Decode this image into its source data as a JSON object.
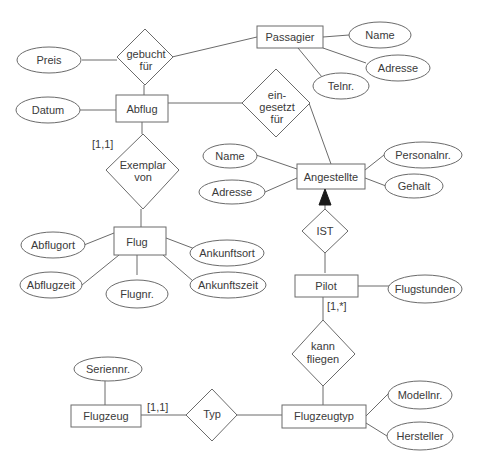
{
  "diagram": {
    "type": "er-diagram",
    "entities": {
      "passagier": "Passagier",
      "abflug": "Abflug",
      "flug": "Flug",
      "angestellte": "Angestellte",
      "pilot": "Pilot",
      "flugzeug": "Flugzeug",
      "flugzeugtyp": "Flugzeugtyp"
    },
    "relationships": {
      "gebucht_fuer": [
        "gebucht",
        "für"
      ],
      "eingesetzt_fuer": [
        "ein-",
        "gesetzt",
        "für"
      ],
      "exemplar_von": [
        "Exemplar",
        "von"
      ],
      "ist": "IST",
      "kann_fliegen": [
        "kann",
        "fliegen"
      ],
      "typ": "Typ"
    },
    "attributes": {
      "passagier_name": "Name",
      "passagier_adresse": "Adresse",
      "passagier_telnr": "Telnr.",
      "preis": "Preis",
      "datum": "Datum",
      "angestellte_name": "Name",
      "angestellte_adresse": "Adresse",
      "personalnr": "Personalnr.",
      "gehalt": "Gehalt",
      "abflugort": "Abflugort",
      "abflugzeit": "Abflugzeit",
      "flugnr": "Flugnr.",
      "ankunftsort": "Ankunftsort",
      "ankunftszeit": "Ankunftszeit",
      "flugstunden": "Flugstunden",
      "seriennr": "Seriennr.",
      "modellnr": "Modellnr.",
      "hersteller": "Hersteller"
    },
    "cardinalities": {
      "abflug_exemplar": "[1,1]",
      "pilot_kann_fliegen": "[1,*]",
      "flugzeug_typ": "[1,1]"
    },
    "colors": {
      "stroke": "#6b6b6b",
      "text": "#3a3a3a",
      "arrow": "#1a1a1a",
      "background": "#ffffff"
    }
  }
}
